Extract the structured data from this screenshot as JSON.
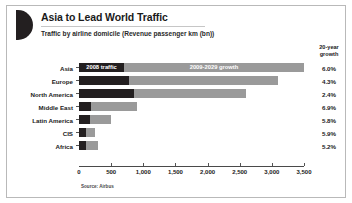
{
  "header": {
    "title": "Asia to Lead World Traffic",
    "subtitle": "Traffic by airline domicile (Revenue passenger km (bn))",
    "logo_icon": "half-circle-icon"
  },
  "growth_column": {
    "header_line1": "20-year",
    "header_line2": "growth"
  },
  "source": "Source: Airbus",
  "colors": {
    "traffic_2008": "#231f20",
    "growth_2009_2029": "#9a9a9a",
    "axis": "#4a4a4a",
    "border": "#b9b9b9"
  },
  "chart_data": {
    "type": "bar",
    "orientation": "horizontal",
    "stacked": true,
    "title": "Asia to Lead World Traffic",
    "subtitle": "Traffic by airline domicile (Revenue passenger km (bn))",
    "xlabel": "",
    "ylabel": "",
    "xlim": [
      0,
      3500
    ],
    "xticks": [
      0,
      500,
      1000,
      1500,
      2000,
      2500,
      3000,
      3500
    ],
    "xtick_labels": [
      "0",
      "500",
      "1,000",
      "1,500",
      "2,000",
      "2,500",
      "3,000",
      "3,500"
    ],
    "grid": false,
    "legend_position": "in-bar-top",
    "categories": [
      "Asia",
      "Europe",
      "North America",
      "Middle East",
      "Latin America",
      "CIS",
      "Africa"
    ],
    "series": [
      {
        "name": "2008 traffic",
        "color": "#231f20",
        "values": [
          700,
          780,
          850,
          180,
          175,
          110,
          105
        ]
      },
      {
        "name": "2009-2029 growth",
        "color": "#9a9a9a",
        "values": [
          2800,
          2320,
          1750,
          720,
          325,
          140,
          185
        ]
      }
    ],
    "totals": [
      3500,
      3100,
      2600,
      900,
      500,
      250,
      290
    ],
    "annotations": {
      "growth_header": "20-year growth",
      "growth_values": [
        "6.0%",
        "4.3%",
        "2.4%",
        "6.9%",
        "5.8%",
        "5.9%",
        "5.2%"
      ]
    },
    "source": "Source: Airbus"
  }
}
